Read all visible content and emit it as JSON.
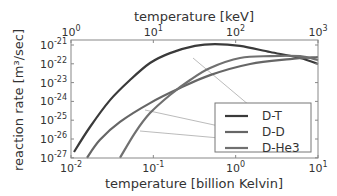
{
  "chart_data": {
    "type": "line",
    "title": "",
    "xlabel": "temperature  [billion Kelvin]",
    "x2label": "temperature  [keV]",
    "ylabel": "reaction rate  [m³/sec]",
    "xscale": "log",
    "yscale": "log",
    "xlim": [
      0.01,
      10
    ],
    "x2lim": [
      1,
      1000
    ],
    "ylim": [
      1e-27,
      1.8e-21
    ],
    "xticks": [
      {
        "exp": "-2",
        "v": -2
      },
      {
        "exp": "-1",
        "v": -1
      },
      {
        "exp": "0",
        "v": 0
      },
      {
        "exp": "1",
        "v": 1
      }
    ],
    "x2ticks": [
      {
        "exp": "0",
        "v": 0
      },
      {
        "exp": "1",
        "v": 1
      },
      {
        "exp": "2",
        "v": 2
      },
      {
        "exp": "3",
        "v": 3
      }
    ],
    "yticks": [
      {
        "exp": "-21",
        "v": -21
      },
      {
        "exp": "-22",
        "v": -22
      },
      {
        "exp": "-23",
        "v": -23
      },
      {
        "exp": "-24",
        "v": -24
      },
      {
        "exp": "-25",
        "v": -25
      },
      {
        "exp": "-26",
        "v": -26
      },
      {
        "exp": "-27",
        "v": -27
      }
    ],
    "legend_position": "lower right",
    "series": [
      {
        "name": "D-T",
        "color": "#3a3a3a",
        "log10_x_GK": [
          -1.964,
          -1.769,
          -1.526,
          -1.283,
          -1.04,
          -0.797,
          -0.494,
          -0.251,
          0.053,
          0.418,
          0.782,
          1.0
        ],
        "log10_rate": [
          -26.69,
          -25.36,
          -23.93,
          -22.86,
          -21.96,
          -21.43,
          -21.05,
          -20.95,
          -21.05,
          -21.37,
          -21.69,
          -22.01
        ],
        "leader_to_legend": [
          [
            193,
            58
          ],
          [
            268,
            121
          ]
        ]
      },
      {
        "name": "D-D",
        "color": "#666666",
        "log10_x_GK": [
          -1.806,
          -1.648,
          -1.405,
          -1.04,
          -0.676,
          -0.311,
          0.175,
          0.661,
          1.0
        ],
        "log10_rate": [
          -27.0,
          -26.04,
          -25.09,
          -24.09,
          -23.29,
          -22.6,
          -22.01,
          -21.75,
          -21.64
        ],
        "leader_to_legend": [
          [
            145,
            110
          ],
          [
            265,
            136
          ]
        ]
      },
      {
        "name": "D-He3",
        "color": "#707070",
        "log10_x_GK": [
          -1.405,
          -1.223,
          -1.04,
          -0.797,
          -0.554,
          -0.311,
          0.053,
          0.418,
          0.782,
          1.0
        ],
        "log10_rate": [
          -27.0,
          -25.67,
          -24.62,
          -23.66,
          -22.86,
          -22.22,
          -21.69,
          -21.59,
          -21.59,
          -21.8
        ],
        "leader_to_legend": [
          [
            140,
            131
          ],
          [
            265,
            142
          ]
        ]
      }
    ]
  }
}
